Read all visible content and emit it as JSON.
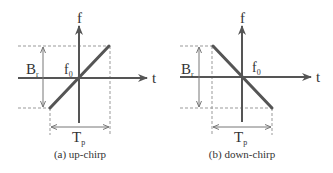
{
  "diagrams": [
    {
      "id": "up-chirp",
      "caption": "(a) up-chirp",
      "axis_labels": {
        "vertical": "f",
        "horizontal": "t"
      },
      "center_label": {
        "base": "f",
        "sub": "0"
      },
      "bandwidth_label": {
        "base": "B",
        "sub": "r"
      },
      "duration_label": {
        "base": "T",
        "sub": "p"
      },
      "slope": "positive"
    },
    {
      "id": "down-chirp",
      "caption": "(b) down-chirp",
      "axis_labels": {
        "vertical": "f",
        "horizontal": "t"
      },
      "center_label": {
        "base": "f",
        "sub": "0"
      },
      "bandwidth_label": {
        "base": "B",
        "sub": "r"
      },
      "duration_label": {
        "base": "T",
        "sub": "p"
      },
      "slope": "negative"
    }
  ],
  "colors": {
    "axis": "#555555",
    "chirp_line": "#555555",
    "dashed_guides": "#999999",
    "text": "#333333"
  }
}
